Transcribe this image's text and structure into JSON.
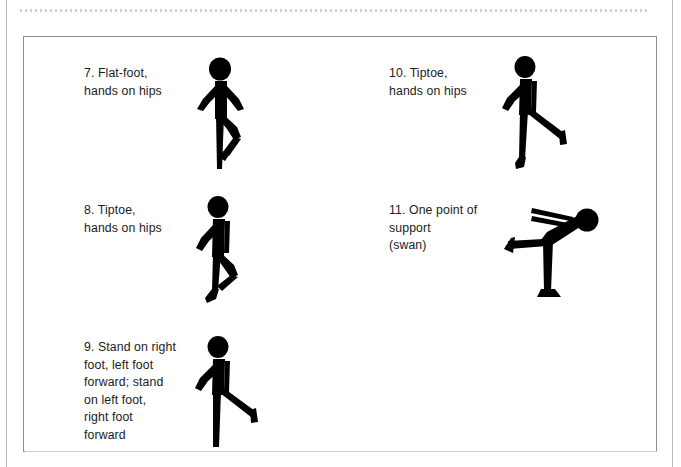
{
  "page": {
    "background_color": "#ffffff",
    "ink_color": "#000000",
    "border_color": "#8d8d8d",
    "rule_color": "#d0d0d0"
  },
  "figure_box": {
    "name": "balance-exercise-panel"
  },
  "exercises": [
    {
      "number": "7.",
      "label": "7. Flat-foot,\n    hands on hips",
      "pose_name": "flat-foot-hands-on-hips",
      "column": "left"
    },
    {
      "number": "8.",
      "label": "8. Tiptoe,\n    hands on hips",
      "pose_name": "tiptoe-hands-on-hips",
      "column": "left"
    },
    {
      "number": "9.",
      "label": "9. Stand on right\n    foot, left foot\n    forward; stand\n    on left foot,\n    right foot\n    forward",
      "pose_name": "stand-one-foot-other-forward",
      "column": "left"
    },
    {
      "number": "10.",
      "label": "10. Tiptoe,\n      hands on hips",
      "pose_name": "tiptoe-leg-forward",
      "column": "right"
    },
    {
      "number": "11.",
      "label": "11. One point of\n      support\n      (swan)",
      "pose_name": "one-point-support-swan",
      "column": "right"
    }
  ]
}
